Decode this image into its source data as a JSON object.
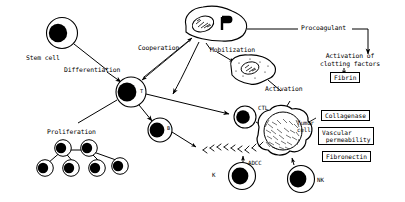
{
  "figure": {
    "type": "biomedical-schematic",
    "background": "#ffffff",
    "ink": "#000000",
    "width": 405,
    "height": 202
  },
  "cells": {
    "stem": {
      "label": "Stem cell",
      "x": 62,
      "y": 33,
      "r": 16
    },
    "t": {
      "label": "T",
      "x": 131,
      "y": 92,
      "r": 15
    },
    "b": {
      "label": "B",
      "x": 160,
      "y": 130,
      "r": 12
    },
    "macrophage": {
      "label": "Mφ",
      "x": 213,
      "y": 24
    },
    "activated_macrophage": {
      "label": "",
      "x": 249,
      "y": 70
    },
    "ctl": {
      "label": "CTL",
      "x": 245,
      "y": 117,
      "r": 11
    },
    "tumor": {
      "label": "Tumor\ncell",
      "x": 281,
      "y": 134,
      "r": 20
    },
    "k": {
      "label": "K",
      "x": 242,
      "y": 176,
      "r": 13
    },
    "nk": {
      "label": "NK",
      "x": 301,
      "y": 179,
      "r": 13
    },
    "proliferation_cluster": {
      "label": "Proliferation",
      "count": 6
    }
  },
  "labels": {
    "stem_cell": "Stem cell",
    "differentiation": "Differentiation",
    "proliferation": "Proliferation",
    "cooperation": "Cooperation",
    "macrophage": "Mφ",
    "mobilization": "Mobilization",
    "activation": "Activation",
    "procoagulant": "Procoagulant",
    "activation_of_clotting_factors": "Activation of\nclotting factors",
    "t_cell": "T",
    "b_cell": "B",
    "ctl": "CTL",
    "tumor_cell": "Tumor\ncell",
    "adcc": "ADCC",
    "k_cell": "K",
    "nk_cell": "NK"
  },
  "boxes": [
    {
      "name": "fibrin",
      "text": "Fibrin",
      "x": 330,
      "y": 72,
      "w": 28,
      "h": 11
    },
    {
      "name": "collagenase",
      "text": "Collagenase",
      "x": 321,
      "y": 110,
      "w": 55,
      "h": 11
    },
    {
      "name": "vascular-permeability",
      "text": "Vascular\n permeability",
      "x": 318,
      "y": 128,
      "w": 62,
      "h": 17
    },
    {
      "name": "fibronectin",
      "text": "Fibronectin",
      "x": 322,
      "y": 151,
      "w": 51,
      "h": 11
    }
  ],
  "arrows": [
    {
      "from": "stem cell",
      "to": "T cell",
      "label": "Differentiation"
    },
    {
      "from": "T cell",
      "to": "B cell",
      "label": ""
    },
    {
      "from": "T cell",
      "to": "proliferation cluster",
      "label": "Proliferation"
    },
    {
      "from": "T cell",
      "to": "macrophage",
      "label": "Cooperation"
    },
    {
      "from": "macrophage",
      "to": "T cell",
      "label": "Cooperation"
    },
    {
      "from": "macrophage",
      "to": "activated macrophage",
      "label": "Mobilization"
    },
    {
      "from": "macrophage",
      "to": "clotting factors",
      "label": "Procoagulant"
    },
    {
      "from": "activated macrophage",
      "to": "tumor cell",
      "label": "Activation"
    },
    {
      "from": "T cell",
      "to": "CTL",
      "label": ""
    },
    {
      "from": "CTL",
      "to": "tumor cell",
      "label": ""
    },
    {
      "from": "B cell",
      "to": "antibody",
      "label": ""
    },
    {
      "from": "K cell",
      "to": "tumor cell",
      "label": "ADCC"
    },
    {
      "from": "NK cell",
      "to": "tumor cell",
      "label": ""
    },
    {
      "from": "clotting factors",
      "to": "Fibrin",
      "label": ""
    }
  ]
}
